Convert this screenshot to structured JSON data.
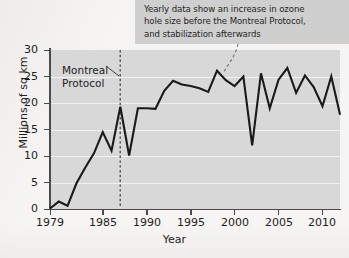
{
  "figure": {
    "background_color": "#f6f5f3",
    "plot_background_color": "#d8d8d8",
    "gridline_color": "#f1f1f1",
    "axis_color": "#4a4a4a",
    "series_color": "#1a1a1a",
    "annotation_background_color": "#cfcfcf"
  },
  "annotation": {
    "text": "Yearly data show an increase in ozone\nhole size before the Montreal Protocol,\nand stabilization afterwards",
    "leader_target_year": 1998
  },
  "marker": {
    "label": "Montreal\nProtocol",
    "year": 1987,
    "style": "dashed-vertical-line"
  },
  "chart_data": {
    "type": "line",
    "title": "",
    "xlabel": "Year",
    "ylabel": "Millions of sq km",
    "xlim": [
      1979,
      2012
    ],
    "ylim": [
      0,
      30
    ],
    "xticks": [
      1979,
      1985,
      1990,
      1995,
      2000,
      2005,
      2010
    ],
    "xtick_labels": [
      "1979",
      "1985",
      "1990",
      "1995",
      "2000",
      "2005",
      "2010"
    ],
    "yticks": [
      0,
      5,
      10,
      15,
      20,
      25,
      30
    ],
    "ytick_labels": [
      "0",
      "5",
      "10",
      "15",
      "20",
      "25",
      "30"
    ],
    "grid": "horizontal",
    "legend": "none",
    "x": [
      1979,
      1980,
      1981,
      1982,
      1983,
      1984,
      1985,
      1986,
      1987,
      1988,
      1989,
      1990,
      1991,
      1992,
      1993,
      1994,
      1995,
      1996,
      1997,
      1998,
      1999,
      2000,
      2001,
      2002,
      2003,
      2004,
      2005,
      2006,
      2007,
      2008,
      2009,
      2010,
      2011,
      2012
    ],
    "values": [
      0.1,
      1.4,
      0.6,
      4.8,
      7.8,
      10.5,
      14.5,
      11.0,
      19.3,
      10.1,
      19.0,
      19.0,
      18.9,
      22.3,
      24.2,
      23.5,
      23.2,
      22.8,
      22.1,
      26.1,
      24.3,
      23.2,
      25.0,
      12.0,
      25.6,
      19.0,
      24.4,
      26.6,
      21.9,
      25.2,
      23.0,
      19.4,
      25.0,
      17.8
    ],
    "series": [
      {
        "name": "Antarctic ozone hole size",
        "values": [
          0.1,
          1.4,
          0.6,
          4.8,
          7.8,
          10.5,
          14.5,
          11.0,
          19.3,
          10.1,
          19.0,
          19.0,
          18.9,
          22.3,
          24.2,
          23.5,
          23.2,
          22.8,
          22.1,
          26.1,
          24.3,
          23.2,
          25.0,
          12.0,
          25.6,
          19.0,
          24.4,
          26.6,
          21.9,
          25.2,
          23.0,
          19.4,
          25.0,
          17.8
        ]
      }
    ]
  }
}
